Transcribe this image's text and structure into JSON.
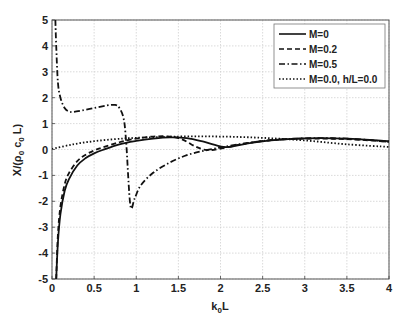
{
  "chart_data": {
    "type": "line",
    "title": "",
    "xlabel": "k0L",
    "xlabel_main": "k",
    "xlabel_sub": "0",
    "xlabel_tail": "L",
    "ylabel": "X/(ρ0 c0 L)",
    "xlim": [
      0,
      4
    ],
    "ylim": [
      -5,
      5
    ],
    "xticks": [
      0,
      0.5,
      1,
      1.5,
      2,
      2.5,
      3,
      3.5,
      4
    ],
    "xtick_labels": [
      "0",
      "0.5",
      "1",
      "1.5",
      "2",
      "2.5",
      "3",
      "3.5",
      "4"
    ],
    "yticks": [
      -5,
      -4,
      -3,
      -2,
      -1,
      0,
      1,
      2,
      3,
      4,
      5
    ],
    "ytick_labels": [
      "-5",
      "-4",
      "-3",
      "-2",
      "-1",
      "0",
      "1",
      "2",
      "3",
      "4",
      "5"
    ],
    "grid": true,
    "legend_position": "upper right",
    "series": [
      {
        "name": "M=0",
        "style": "solid",
        "x": [
          0.05,
          0.07,
          0.1,
          0.15,
          0.2,
          0.3,
          0.4,
          0.5,
          0.6,
          0.8,
          1.0,
          1.2,
          1.4,
          1.6,
          1.8,
          2.0,
          2.1,
          2.3,
          2.6,
          3.0,
          3.5,
          4.0
        ],
        "y": [
          -5,
          -3.6,
          -2.5,
          -1.6,
          -1.15,
          -0.62,
          -0.33,
          -0.15,
          -0.02,
          0.2,
          0.33,
          0.42,
          0.47,
          0.44,
          0.3,
          0.12,
          0.1,
          0.22,
          0.35,
          0.43,
          0.42,
          0.32
        ]
      },
      {
        "name": "M=0.2",
        "style": "dashed",
        "x": [
          0.05,
          0.07,
          0.1,
          0.15,
          0.2,
          0.3,
          0.4,
          0.5,
          0.6,
          0.8,
          1.0,
          1.2,
          1.4,
          1.55,
          1.7,
          1.8,
          1.9,
          2.1,
          2.3,
          2.6,
          3.0,
          3.5,
          4.0
        ],
        "y": [
          -5,
          -3.3,
          -2.2,
          -1.35,
          -0.92,
          -0.45,
          -0.2,
          -0.04,
          0.08,
          0.28,
          0.42,
          0.5,
          0.5,
          0.38,
          0.12,
          0.0,
          -0.02,
          0.1,
          0.24,
          0.36,
          0.42,
          0.4,
          0.3
        ]
      },
      {
        "name": "M=0.5",
        "style": "dashdot",
        "x": [
          0.04,
          0.05,
          0.07,
          0.1,
          0.15,
          0.2,
          0.25,
          0.35,
          0.5,
          0.65,
          0.75,
          0.8,
          0.85,
          0.88,
          0.93,
          0.98,
          1.05,
          1.2,
          1.4,
          1.6,
          1.8,
          2.0,
          2.3,
          2.6,
          3.0,
          3.5,
          4.0
        ],
        "y": [
          5,
          4.0,
          2.6,
          2.0,
          1.6,
          1.47,
          1.45,
          1.5,
          1.6,
          1.7,
          1.72,
          1.6,
          1.2,
          0.3,
          -2.15,
          -1.9,
          -1.4,
          -0.9,
          -0.5,
          -0.22,
          -0.05,
          0.08,
          0.24,
          0.36,
          0.43,
          0.42,
          0.3
        ]
      },
      {
        "name": "M=0.0, h/L=0.0",
        "style": "dotted",
        "x": [
          0,
          0.25,
          0.5,
          0.75,
          1.0,
          1.5,
          2.0,
          2.5,
          3.0,
          3.5,
          4.0
        ],
        "y": [
          0.02,
          0.2,
          0.32,
          0.4,
          0.45,
          0.5,
          0.5,
          0.45,
          0.35,
          0.2,
          0.1
        ]
      }
    ]
  }
}
